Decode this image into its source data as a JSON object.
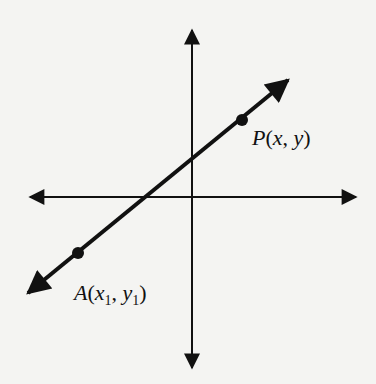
{
  "diagram": {
    "type": "coordinate-plane-line",
    "colors": {
      "background": "#f4f4f2",
      "ink": "#111111"
    },
    "axes": {
      "origin": [
        192,
        197
      ],
      "x_axis": {
        "from": [
          30,
          197
        ],
        "to": [
          356,
          197
        ],
        "arrows": "both"
      },
      "y_axis": {
        "from": [
          192,
          30
        ],
        "to": [
          192,
          368
        ],
        "arrows": "both"
      }
    },
    "line": {
      "from": [
        28,
        293
      ],
      "to": [
        288,
        80
      ],
      "arrows": "both"
    },
    "points": [
      {
        "name": "P",
        "position": [
          242,
          120
        ],
        "label": "P(x, y)",
        "label_parts": {
          "name": "P",
          "open": "(",
          "a": "x",
          "sep": ", ",
          "b": "y",
          "close": ")"
        }
      },
      {
        "name": "A",
        "position": [
          78,
          253
        ],
        "label": "A(x1, y1)",
        "label_parts": {
          "name": "A",
          "open": "(",
          "a": "x",
          "a_sub": "1",
          "sep": ", ",
          "b": "y",
          "b_sub": "1",
          "close": ")"
        }
      }
    ]
  }
}
